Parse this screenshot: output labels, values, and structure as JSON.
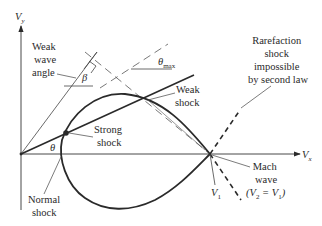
{
  "axes": {
    "y_label": "V",
    "y_sub": "y",
    "x_label": "V",
    "x_sub": "x"
  },
  "labels": {
    "weak_wave_angle": [
      "Weak",
      "wave",
      "angle"
    ],
    "beta": "β",
    "theta_max": "θ",
    "theta_max_sub": "max",
    "weak_shock": [
      "Weak",
      "shock"
    ],
    "strong_shock": [
      "Strong",
      "shock"
    ],
    "theta": "θ",
    "normal_shock": [
      "Normal",
      "shock"
    ],
    "rarefaction": [
      "Rarefaction",
      "shock",
      "impossible",
      "by second law"
    ],
    "v1": "V",
    "v1_sub": "1",
    "mach_wave": [
      "Mach",
      "wave"
    ],
    "mach_eq": {
      "open": "(V",
      "sub2": "2",
      "eq": " = V",
      "sub1": "1",
      "close": ")"
    }
  },
  "colors": {
    "line": "#2a2a2a",
    "thin": "#444444",
    "dashed": "#555555"
  }
}
